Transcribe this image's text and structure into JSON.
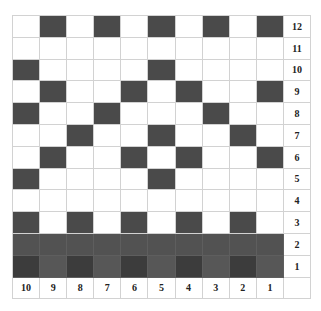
{
  "title": "",
  "colors": {
    "filled": "#4a4a4a",
    "row2_filled": "#525252",
    "row1_dark": "#3c3c3c",
    "row1_light": "#575757",
    "empty": "#ffffff",
    "gridline": "#d2d2d2"
  },
  "column_labels": [
    "10",
    "9",
    "8",
    "7",
    "6",
    "5",
    "4",
    "3",
    "2",
    "1"
  ],
  "rows": [
    {
      "label": "12",
      "filled": [
        1,
        3,
        5,
        7,
        9
      ]
    },
    {
      "label": "11",
      "filled": []
    },
    {
      "label": "10",
      "filled": [
        0,
        5
      ]
    },
    {
      "label": "9",
      "filled": [
        1,
        4,
        6,
        9
      ]
    },
    {
      "label": "8",
      "filled": [
        0,
        3,
        7
      ]
    },
    {
      "label": "7",
      "filled": [
        2,
        5,
        8
      ]
    },
    {
      "label": "6",
      "filled": [
        1,
        4,
        6,
        9
      ]
    },
    {
      "label": "5",
      "filled": [
        0,
        5
      ]
    },
    {
      "label": "4",
      "filled": []
    },
    {
      "label": "3",
      "filled": [
        0,
        2,
        4,
        6,
        8
      ]
    },
    {
      "label": "2",
      "filled": [
        0,
        1,
        2,
        3,
        4,
        5,
        6,
        7,
        8,
        9
      ],
      "style": "row2"
    },
    {
      "label": "1",
      "filled": [
        0,
        1,
        2,
        3,
        4,
        5,
        6,
        7,
        8,
        9
      ],
      "style": "row1"
    }
  ]
}
